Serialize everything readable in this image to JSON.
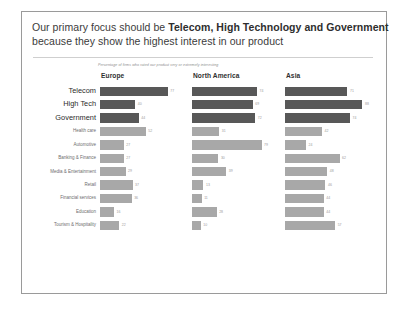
{
  "slide": {
    "title_line1_prefix": "Our primary focus should be ",
    "title_line1_bold": "Telecom, High Technology and Government",
    "title_line2": "because they show the highest interest in our product",
    "subtitle": "Percentage of firms who rated our product very or extremely interesting",
    "colors": {
      "bar_dark": "#585858",
      "bar_light": "#a8a8a8",
      "title_text": "#3b3b3b",
      "border": "#9a9a9a",
      "background": "#ffffff"
    }
  },
  "chart_data": {
    "type": "bar",
    "title": "Our primary focus should be Telecom, High Technology and Government because they show the highest interest in our product",
    "subtitle": "Percentage of firms who rated our product very or extremely interesting",
    "xlabel": "",
    "ylabel": "",
    "grid": false,
    "legend": "none",
    "orientation": "horizontal",
    "panels": [
      "Europe",
      "North America",
      "Asia"
    ],
    "categories": [
      "Telecom",
      "High Tech",
      "Government",
      "Health care",
      "Automotive",
      "Banking & Finance",
      "Media & Entertainment",
      "Retail",
      "Financial services",
      "Education",
      "Tourism & Hospitality"
    ],
    "highlighted_categories": [
      "Telecom",
      "High Tech",
      "Government"
    ],
    "xlim": [
      0,
      100
    ],
    "series": [
      {
        "name": "Europe",
        "values": [
          77,
          40,
          44,
          52,
          27,
          27,
          29,
          37,
          36,
          16,
          22
        ],
        "emphasis": [
          true,
          true,
          true,
          false,
          false,
          false,
          false,
          false,
          false,
          false,
          false
        ]
      },
      {
        "name": "North America",
        "values": [
          74,
          69,
          72,
          31,
          79,
          30,
          39,
          13,
          11,
          28,
          10
        ],
        "emphasis": [
          true,
          true,
          true,
          false,
          false,
          false,
          false,
          false,
          false,
          false,
          false
        ]
      },
      {
        "name": "Asia",
        "values": [
          71,
          88,
          74,
          42,
          24,
          62,
          48,
          46,
          44,
          44,
          57
        ],
        "emphasis": [
          true,
          true,
          true,
          false,
          false,
          false,
          false,
          false,
          false,
          false,
          false
        ]
      }
    ]
  }
}
